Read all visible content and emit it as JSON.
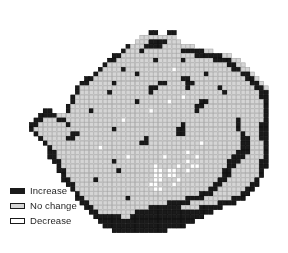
{
  "figure": {
    "background_color": "#ffffff"
  },
  "legend": {
    "name": "change-category-legend",
    "items": [
      {
        "label": "Increase",
        "color": "#1a1a1a",
        "border": "#1a1a1a"
      },
      {
        "label": "No change",
        "color": "#d5d5d5",
        "border": "#1a1a1a"
      },
      {
        "label": "Decrease",
        "color": "#ffffff",
        "border": "#1a1a1a"
      }
    ]
  },
  "chart_data": {
    "type": "heatmap",
    "subtitle": "",
    "xlabel": "",
    "ylabel": "",
    "grid": true,
    "legend_position": "bottom-left",
    "categories": [
      "Increase",
      "No change",
      "Decrease"
    ],
    "category_colors": {
      "Increase": "#1a1a1a",
      "No change": "#d5d5d5",
      "Decrease": "#ffffff",
      "outside": "#ffffff"
    },
    "cell_size_px": 4.6,
    "origin_px": [
      20,
      12
    ],
    "grid_cols": 54,
    "grid_rows": 50,
    "encoding": {
      "0": "outside",
      "1": "No change",
      "2": "Increase",
      "3": "Decrease"
    },
    "cells": [
      "000000000000000000000000000000000000000000000000000000",
      "000000000000000000000000000000000000000000000000000000",
      "000000000000000000000000000000000000000000000000000000",
      "000000000000000000000000000000000000000000000000000000",
      "000000000000000000000000000022002200000000000000000000",
      "000000000000000000000000001111111100000000000000000000",
      "000000000000000000000000011122221110000000000000000000",
      "000000000000000000000002111222211111110000000000000000",
      "000000000000000000000021112111111112222211000000000000",
      "000000000000000000002211111111111111112222221100000000",
      "000000000000000000022111111112111112111111222211000000",
      "000000000000000000211111111111111111111111111221100000",
      "000000000000000002111121111111111311111111111122110000",
      "000000000000000021111111121111111111111121111111221000",
      "000000000000002211111111111111111112211111111111122100",
      "000000000000022111112111111111221111221111111111112210",
      "000000000000211111111111111122111111211111121111111221",
      "000000000000211111121111111121111111111111112111111122",
      "000000000002111111111111111111111113111111111111111122",
      "000000000002111111111111121111113111111221111111111112",
      "000000000021111111111111111111111111112211111111111112",
      "000002200021111211111111111131111111112111111111111112",
      "000022221111111111111111111111111111111111111111111112",
      "000221112211111111111131111111111111111111111112111112",
      "002211111121111111111111111111111112111111111112111122",
      "002111111111111111112111111111111122111111111112111122",
      "000211111112211111111111111111111122111111111111211122",
      "000021111122111111111111111211111111111111111111221122",
      "000002111111111111111111112211111111111311111111221112",
      "000000211111111113111111111111111111111111111111221112",
      "000000221111111111111111111111111111311111111112221112",
      "000000221111111111111113111111131111113111111122211112",
      "000000022111111111112111111111111111311111111222111122",
      "000000002111111111111111111113111131133111111221111122",
      "000000002211111111111211111113313311311111112211111120",
      "000000000211111111111111111113313311111111112211111120",
      "000000000221111121111111111113311131111111122111111200",
      "000000000022111111111111111133111311111111221111112200",
      "000000000002111111111111111113311111111112211111122000",
      "000000000000211111111111111111111111111222111111220000",
      "000000000000221111111112111111111111222211111122200000",
      "000000000000022111111111111111112222211111122220000000",
      "000000000000002211111111111122222221111222220000000000",
      "000000000000000221111111122222222222222222000000000000",
      "000000000000000022222211222222222222222200000000000000",
      "000000000000000002222222222222222222220000000000000000",
      "000000000000000000222222222222222222000000000000000000",
      "000000000000000000002222222222220000000000000000000000",
      "000000000000000000000000000000000000000000000000000000",
      "000000000000000000000000000000000000000000000000000000"
    ]
  }
}
